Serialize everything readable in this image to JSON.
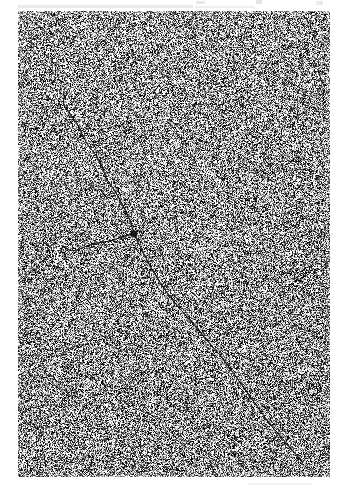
{
  "page": {
    "background_color": "#ffffff",
    "width": 341,
    "height": 491
  },
  "micrograph": {
    "label": "electron-micrograph-plate",
    "x": 18,
    "y": 11,
    "width": 312,
    "height": 466,
    "background_color": "#8e8e8e",
    "grain": {
      "description": "high-contrast salt-and-pepper emulsion grain",
      "cell_size": 1,
      "mean_gray": "#8e8e8e",
      "contrast": 0.95,
      "seed": 20241
    },
    "border_color": "#b4b4b4"
  },
  "scan_artifacts": [
    {
      "name": "top-smudge-left",
      "x": 18,
      "y": 5,
      "width": 175,
      "height": 3,
      "color": "#e6e6e6"
    },
    {
      "name": "top-smudge-mid",
      "x": 195,
      "y": 6,
      "width": 60,
      "height": 2,
      "color": "#ececec"
    },
    {
      "name": "top-speck-a",
      "x": 196,
      "y": 1,
      "width": 9,
      "height": 3,
      "color": "#e4e4e4"
    },
    {
      "name": "top-speck-b",
      "x": 256,
      "y": 0,
      "width": 6,
      "height": 4,
      "color": "#e2e2e2"
    },
    {
      "name": "top-speck-c",
      "x": 316,
      "y": 1,
      "width": 7,
      "height": 4,
      "color": "#e6e6e6"
    },
    {
      "name": "bottom-smudge",
      "x": 248,
      "y": 483,
      "width": 64,
      "height": 2,
      "color": "#ededed"
    }
  ],
  "chart_data": {
    "type": "scatter",
    "xlabel": "",
    "ylabel": "",
    "filament_color": "#1d1d1d",
    "filament_width": 1.1,
    "strands": [
      {
        "name": "main-strand",
        "points": [
          [
            68,
            93
          ],
          [
            64,
            97
          ],
          [
            63,
            103
          ],
          [
            66,
            109
          ],
          [
            71,
            115
          ],
          [
            76,
            122
          ],
          [
            80,
            129
          ],
          [
            83,
            136
          ],
          [
            86,
            142
          ],
          [
            90,
            148
          ],
          [
            95,
            154
          ],
          [
            99,
            160
          ],
          [
            102,
            166
          ],
          [
            104,
            172
          ],
          [
            106,
            178
          ],
          [
            110,
            184
          ],
          [
            114,
            190
          ],
          [
            118,
            196
          ],
          [
            121,
            202
          ],
          [
            124,
            208
          ],
          [
            127,
            214
          ],
          [
            130,
            220
          ],
          [
            132,
            227
          ],
          [
            134,
            234
          ]
        ]
      },
      {
        "name": "lower-strand",
        "points": [
          [
            134,
            234
          ],
          [
            138,
            242
          ],
          [
            142,
            250
          ],
          [
            146,
            258
          ],
          [
            150,
            266
          ],
          [
            155,
            274
          ],
          [
            160,
            282
          ],
          [
            165,
            290
          ],
          [
            170,
            297
          ],
          [
            176,
            304
          ],
          [
            182,
            311
          ],
          [
            188,
            318
          ],
          [
            194,
            325
          ],
          [
            200,
            332
          ],
          [
            206,
            339
          ],
          [
            212,
            346
          ],
          [
            218,
            353
          ],
          [
            224,
            360
          ],
          [
            229,
            367
          ],
          [
            234,
            374
          ],
          [
            239,
            381
          ],
          [
            244,
            388
          ],
          [
            249,
            395
          ],
          [
            254,
            402
          ],
          [
            259,
            409
          ],
          [
            264,
            416
          ],
          [
            269,
            423
          ],
          [
            275,
            430
          ],
          [
            281,
            437
          ],
          [
            287,
            444
          ],
          [
            293,
            451
          ],
          [
            298,
            457
          ],
          [
            302,
            462
          ]
        ]
      },
      {
        "name": "branch-arc",
        "points": [
          [
            134,
            234
          ],
          [
            128,
            235
          ],
          [
            122,
            237
          ],
          [
            116,
            239
          ],
          [
            110,
            241
          ],
          [
            104,
            242
          ],
          [
            98,
            243
          ],
          [
            92,
            244
          ],
          [
            87,
            246
          ],
          [
            82,
            248
          ],
          [
            77,
            250
          ],
          [
            73,
            251
          ],
          [
            69,
            250
          ],
          [
            66,
            248
          ],
          [
            64,
            246
          ],
          [
            62,
            248
          ],
          [
            61,
            251
          ]
        ]
      }
    ],
    "knot": {
      "name": "dense-junction",
      "x": 134,
      "y": 234,
      "radius": 3.4,
      "color": "#141414"
    },
    "specks": [
      [
        64,
        46
      ],
      [
        210,
        41
      ],
      [
        290,
        46
      ],
      [
        120,
        68
      ],
      [
        286,
        80
      ],
      [
        48,
        100
      ],
      [
        242,
        106
      ],
      [
        307,
        119
      ],
      [
        178,
        124
      ],
      [
        60,
        150
      ],
      [
        264,
        154
      ],
      [
        147,
        171
      ],
      [
        318,
        178
      ],
      [
        95,
        190
      ],
      [
        228,
        193
      ],
      [
        38,
        210
      ],
      [
        196,
        216
      ],
      [
        288,
        222
      ],
      [
        134,
        248
      ],
      [
        312,
        251
      ],
      [
        52,
        262
      ],
      [
        244,
        268
      ],
      [
        170,
        284
      ],
      [
        78,
        296
      ],
      [
        262,
        300
      ],
      [
        200,
        310
      ],
      [
        44,
        318
      ],
      [
        296,
        326
      ],
      [
        128,
        334
      ],
      [
        222,
        346
      ],
      [
        66,
        356
      ],
      [
        302,
        361
      ],
      [
        158,
        372
      ],
      [
        248,
        382
      ],
      [
        90,
        390
      ],
      [
        274,
        398
      ],
      [
        184,
        408
      ],
      [
        40,
        414
      ],
      [
        318,
        420
      ],
      [
        112,
        430
      ],
      [
        236,
        438
      ],
      [
        62,
        448
      ],
      [
        288,
        452
      ],
      [
        166,
        460
      ],
      [
        208,
        468
      ],
      [
        100,
        120
      ],
      [
        256,
        200
      ],
      [
        186,
        260
      ],
      [
        140,
        300
      ],
      [
        276,
        340
      ]
    ]
  }
}
